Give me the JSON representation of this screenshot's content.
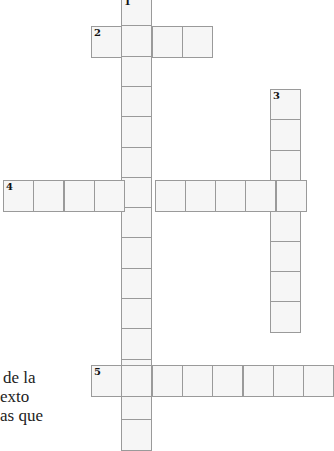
{
  "puzzle": {
    "type": "crossword",
    "cell_size": 30.3,
    "colors": {
      "cell_fill": "#f6f6f6",
      "cell_border": "#9a9a9a",
      "background": "#ffffff"
    },
    "words": [
      {
        "number": "1",
        "direction": "down",
        "start_x": 121,
        "start_y": -5,
        "length": 15
      },
      {
        "number": "2",
        "direction": "across",
        "start_x": 91,
        "start_y": 26,
        "length": 4
      },
      {
        "number": "3",
        "direction": "down",
        "start_x": 270,
        "start_y": 89,
        "length": 8
      },
      {
        "number": "4",
        "direction": "across",
        "start_x": 3,
        "start_y": 180,
        "length": 10
      },
      {
        "number": "5",
        "direction": "across",
        "start_x": 91,
        "start_y": 365,
        "length": 8
      }
    ]
  },
  "clue_fragment": {
    "lines": [
      "de la",
      "exto",
      "as que"
    ]
  }
}
